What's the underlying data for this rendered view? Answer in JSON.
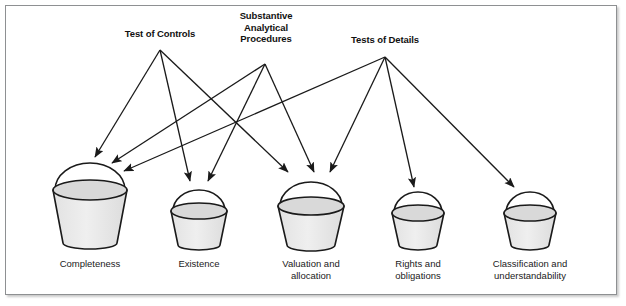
{
  "figure": {
    "background_color": "#ffffff",
    "frame_color": "#8e9092",
    "line_color": "#1a1a1a",
    "bucket_fill": "#d9d9d9",
    "bucket_body_fill": "#e8e8e8"
  },
  "sources": [
    {
      "id": "test-of-controls",
      "label": "Test of Controls",
      "label_x": 160,
      "label_y": 28,
      "origin_x": 160,
      "origin_y": 50
    },
    {
      "id": "substantive-analytical-procedures",
      "label": "Substantive\nAnalytical\nProcedures",
      "label_x": 266,
      "label_y": 10,
      "origin_x": 265,
      "origin_y": 64
    },
    {
      "id": "tests-of-details",
      "label": "Tests of Details",
      "label_x": 385,
      "label_y": 34,
      "origin_x": 385,
      "origin_y": 57
    }
  ],
  "buckets": [
    {
      "id": "completeness",
      "label": "Completeness",
      "label_x": 90,
      "label_y": 258,
      "cx": 90,
      "rim_y": 190,
      "rim_rx": 37,
      "rim_ry": 10,
      "bottom_y": 243,
      "bottom_rx": 27,
      "bottom_ry": 6,
      "handle_top_y": 163
    },
    {
      "id": "existence",
      "label": "Existence",
      "label_x": 199,
      "label_y": 258,
      "cx": 199,
      "rim_y": 211,
      "rim_rx": 28,
      "rim_ry": 8,
      "bottom_y": 245,
      "bottom_rx": 21,
      "bottom_ry": 5,
      "handle_top_y": 190
    },
    {
      "id": "valuation-and-allocation",
      "label": "Valuation and\nallocation",
      "label_x": 311,
      "label_y": 258,
      "cx": 311,
      "rim_y": 206,
      "rim_rx": 33,
      "rim_ry": 9,
      "bottom_y": 245,
      "bottom_rx": 24,
      "bottom_ry": 6,
      "handle_top_y": 182
    },
    {
      "id": "rights-and-obligations",
      "label": "Rights and\nobligations",
      "label_x": 418,
      "label_y": 258,
      "cx": 418,
      "rim_y": 213,
      "rim_rx": 26,
      "rim_ry": 8,
      "bottom_y": 245,
      "bottom_rx": 19,
      "bottom_ry": 5,
      "handle_top_y": 192
    },
    {
      "id": "classification-and-understandability",
      "label": "Classification and\nunderstandability",
      "label_x": 530,
      "label_y": 258,
      "cx": 530,
      "rim_y": 213,
      "rim_rx": 26,
      "rim_ry": 8,
      "bottom_y": 245,
      "bottom_rx": 19,
      "bottom_ry": 5,
      "handle_top_y": 192
    }
  ],
  "arrows": [
    {
      "id": "toc-to-completeness",
      "from": "test-of-controls",
      "to": "completeness",
      "x1": 160,
      "y1": 50,
      "x2": 95,
      "y2": 157
    },
    {
      "id": "toc-to-existence",
      "from": "test-of-controls",
      "to": "existence",
      "x1": 160,
      "y1": 50,
      "x2": 190,
      "y2": 181
    },
    {
      "id": "toc-to-valuation",
      "from": "test-of-controls",
      "to": "valuation-and-allocation",
      "x1": 160,
      "y1": 50,
      "x2": 288,
      "y2": 172
    },
    {
      "id": "sap-to-completeness",
      "from": "substantive-analytical-procedures",
      "to": "completeness",
      "x1": 265,
      "y1": 64,
      "x2": 112,
      "y2": 163
    },
    {
      "id": "sap-to-existence",
      "from": "substantive-analytical-procedures",
      "to": "existence",
      "x1": 265,
      "y1": 64,
      "x2": 208,
      "y2": 181
    },
    {
      "id": "sap-to-valuation",
      "from": "substantive-analytical-procedures",
      "to": "valuation-and-allocation",
      "x1": 265,
      "y1": 64,
      "x2": 314,
      "y2": 172
    },
    {
      "id": "tod-to-completeness",
      "from": "tests-of-details",
      "to": "completeness",
      "x1": 385,
      "y1": 57,
      "x2": 124,
      "y2": 171
    },
    {
      "id": "tod-to-valuation",
      "from": "tests-of-details",
      "to": "valuation-and-allocation",
      "x1": 385,
      "y1": 57,
      "x2": 330,
      "y2": 172
    },
    {
      "id": "tod-to-rights",
      "from": "tests-of-details",
      "to": "rights-and-obligations",
      "x1": 385,
      "y1": 57,
      "x2": 414,
      "y2": 187
    },
    {
      "id": "tod-to-classification",
      "from": "tests-of-details",
      "to": "classification-and-understandability",
      "x1": 385,
      "y1": 57,
      "x2": 514,
      "y2": 187
    }
  ]
}
